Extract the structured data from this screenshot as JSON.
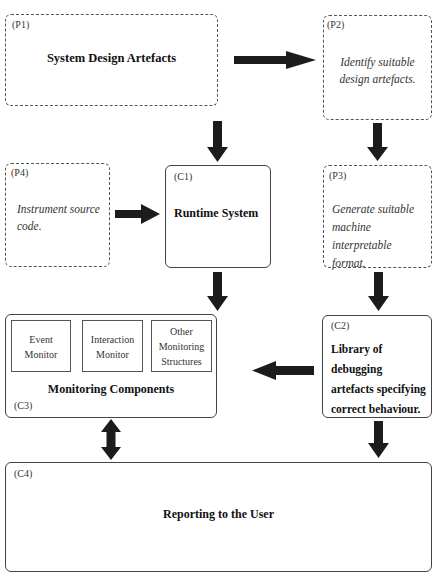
{
  "diagram": {
    "nodes": {
      "p1": {
        "tag": "(P1)",
        "title": "System Design Artefacts",
        "style": "dashed"
      },
      "p2": {
        "tag": "(P2)",
        "text_lines": [
          "Identify suitable",
          "design artefacts."
        ],
        "style": "dashed"
      },
      "p3": {
        "tag": "(P3)",
        "text_lines": [
          "Generate suitable",
          "machine interpretable",
          "format."
        ],
        "style": "dashed"
      },
      "p4": {
        "tag": "(P4)",
        "text_lines": [
          "Instrument source",
          "code."
        ],
        "style": "dashed"
      },
      "c1": {
        "tag": "(C1)",
        "title": "Runtime System",
        "style": "solid"
      },
      "c2": {
        "tag": "(C2)",
        "title_lines": [
          "Library of debugging",
          "artefacts specifying",
          "correct behaviour."
        ],
        "style": "solid"
      },
      "c3": {
        "tag": "(C3)",
        "title": "Monitoring Components",
        "style": "solid",
        "subcomponents": [
          {
            "lines": [
              "Event",
              "Monitor"
            ]
          },
          {
            "lines": [
              "Interaction",
              "Monitor"
            ]
          },
          {
            "lines": [
              "Other",
              "Monitoring",
              "Structures"
            ]
          }
        ]
      },
      "c4": {
        "tag": "(C4)",
        "title": "Reporting to the User",
        "style": "solid"
      }
    },
    "edges": [
      {
        "from": "P1",
        "to": "P2",
        "type": "arrow"
      },
      {
        "from": "P1",
        "to": "C1",
        "type": "arrow"
      },
      {
        "from": "P2",
        "to": "P3",
        "type": "arrow"
      },
      {
        "from": "P4",
        "to": "C1",
        "type": "arrow"
      },
      {
        "from": "C1",
        "to": "C3",
        "type": "arrow"
      },
      {
        "from": "P3",
        "to": "C2",
        "type": "arrow"
      },
      {
        "from": "C2",
        "to": "C3",
        "type": "arrow"
      },
      {
        "from": "C3",
        "to": "C4",
        "type": "bidirectional"
      },
      {
        "from": "C2",
        "to": "C4",
        "type": "arrow"
      }
    ],
    "colors": {
      "arrow": "#1c1c1c",
      "border": "#444444"
    }
  }
}
